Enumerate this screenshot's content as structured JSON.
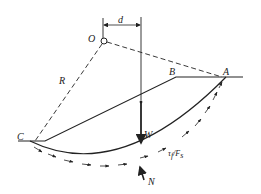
{
  "diagram": {
    "type": "slope-stability-circular-slip",
    "labels": {
      "center": "O",
      "radius": "R",
      "lever_arm": "d",
      "crest_point": "B",
      "top_point": "A",
      "toe_point": "C",
      "weight": "W",
      "normal": "N",
      "shear_main": "τ",
      "shear_sub": "f",
      "shear_div": "/F",
      "shear_div_sub": "s"
    },
    "colors": {
      "stroke": "#222222",
      "background": "#ffffff"
    }
  }
}
